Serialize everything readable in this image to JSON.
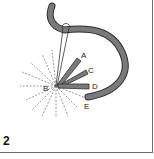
{
  "figure": {
    "step_number": "2",
    "labels": {
      "a": "A",
      "b": "B",
      "c": "C",
      "d": "D",
      "e": "E"
    },
    "colors": {
      "tube_fill": "#7a7a7a",
      "tube_outline": "#2e2e2e",
      "dashed_lines": "#555555",
      "frame_border": "#6e6e6e"
    }
  }
}
